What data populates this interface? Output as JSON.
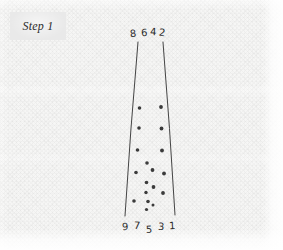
{
  "canvas": {
    "width": 283,
    "height": 250,
    "paper_color": "#f6f6f5",
    "ink_color": "#3a3a3a"
  },
  "label": {
    "text": "Step 1",
    "box_color": "#e9e9e9",
    "text_color": "#2c2c2c"
  },
  "diagram": {
    "name": "hand-drawn-funnel-with-dots",
    "funnel": {
      "top_left": {
        "x": 138,
        "y": 42
      },
      "top_right": {
        "x": 163,
        "y": 42
      },
      "bottom_left": {
        "x": 125,
        "y": 216
      },
      "bottom_right": {
        "x": 175,
        "y": 215
      }
    },
    "top_digits": [
      {
        "text": "8",
        "x": 130,
        "y": 29,
        "rotate": -6
      },
      {
        "text": "6",
        "x": 141,
        "y": 28,
        "rotate": -3
      },
      {
        "text": "4",
        "x": 150,
        "y": 27,
        "rotate": 2
      },
      {
        "text": "2",
        "x": 159,
        "y": 28,
        "rotate": 8
      }
    ],
    "bottom_digits": [
      {
        "text": "9",
        "x": 122,
        "y": 222,
        "rotate": -4
      },
      {
        "text": "7",
        "x": 134,
        "y": 221,
        "rotate": 3
      },
      {
        "text": "5",
        "x": 146,
        "y": 225,
        "rotate": -2
      },
      {
        "text": "3",
        "x": 158,
        "y": 222,
        "rotate": 4
      },
      {
        "text": "1",
        "x": 169,
        "y": 221,
        "rotate": -3
      }
    ],
    "dots": [
      {
        "x": 139.5,
        "y": 108.0,
        "r": 1.8
      },
      {
        "x": 161.0,
        "y": 107.0,
        "r": 1.9
      },
      {
        "x": 139.0,
        "y": 128.0,
        "r": 1.8
      },
      {
        "x": 161.5,
        "y": 128.5,
        "r": 1.9
      },
      {
        "x": 137.5,
        "y": 150.0,
        "r": 1.8
      },
      {
        "x": 162.0,
        "y": 150.5,
        "r": 1.9
      },
      {
        "x": 147.0,
        "y": 163.0,
        "r": 1.8
      },
      {
        "x": 152.5,
        "y": 170.0,
        "r": 1.9
      },
      {
        "x": 136.0,
        "y": 172.5,
        "r": 1.8
      },
      {
        "x": 164.0,
        "y": 173.5,
        "r": 1.9
      },
      {
        "x": 146.5,
        "y": 182.5,
        "r": 1.8
      },
      {
        "x": 153.5,
        "y": 187.0,
        "r": 1.9
      },
      {
        "x": 146.0,
        "y": 192.5,
        "r": 1.7
      },
      {
        "x": 163.0,
        "y": 193.0,
        "r": 1.9
      },
      {
        "x": 134.0,
        "y": 201.0,
        "r": 1.8
      },
      {
        "x": 148.0,
        "y": 201.5,
        "r": 1.8
      },
      {
        "x": 146.5,
        "y": 209.5,
        "r": 1.6
      },
      {
        "x": 153.0,
        "y": 205.0,
        "r": 1.5
      }
    ]
  }
}
